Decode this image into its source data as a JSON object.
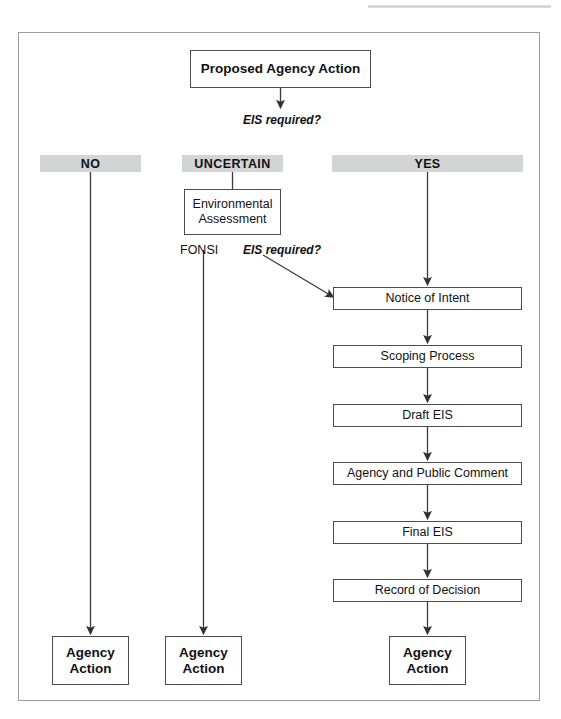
{
  "figure": {
    "frame": {
      "x": 18,
      "y": 32,
      "w": 522,
      "h": 669
    },
    "colors": {
      "band_fill": "#d2d4d6",
      "box_stroke": "#4b4d50",
      "frame_stroke": "#9a9c9f",
      "text": "#111214",
      "connector": "#3a3c3f",
      "page_background": "#ffffff"
    }
  },
  "nodes": {
    "proposed_action": {
      "label": "Proposed Agency Action",
      "x": 190,
      "y": 50,
      "w": 181,
      "h": 38,
      "style": "bold"
    },
    "environmental_assessment": {
      "label": "Environmental\nAssessment",
      "x": 184,
      "y": 189,
      "w": 97,
      "h": 46,
      "style": "plain"
    },
    "notice_of_intent": {
      "label": "Notice of Intent",
      "x": 333,
      "y": 287,
      "w": 189,
      "h": 23,
      "style": "plain"
    },
    "scoping_process": {
      "label": "Scoping Process",
      "x": 333,
      "y": 345,
      "w": 189,
      "h": 23,
      "style": "plain"
    },
    "draft_eis": {
      "label": "Draft EIS",
      "x": 333,
      "y": 404,
      "w": 189,
      "h": 23,
      "style": "plain"
    },
    "agency_public_comment": {
      "label": "Agency and Public Comment",
      "x": 333,
      "y": 462,
      "w": 189,
      "h": 23,
      "style": "plain"
    },
    "final_eis": {
      "label": "Final EIS",
      "x": 333,
      "y": 521,
      "w": 189,
      "h": 23,
      "style": "plain"
    },
    "record_of_decision": {
      "label": "Record of Decision",
      "x": 333,
      "y": 579,
      "w": 189,
      "h": 23,
      "style": "plain"
    },
    "agency_action_no": {
      "label": "Agency\nAction",
      "x": 52,
      "y": 636,
      "w": 77,
      "h": 49,
      "style": "bold"
    },
    "agency_action_uncertain": {
      "label": "Agency\nAction",
      "x": 165,
      "y": 636,
      "w": 77,
      "h": 49,
      "style": "bold"
    },
    "agency_action_yes": {
      "label": "Agency\nAction",
      "x": 389,
      "y": 636,
      "w": 77,
      "h": 49,
      "style": "bold"
    }
  },
  "bands": {
    "no": {
      "label": "NO",
      "x": 40,
      "y": 155,
      "w": 101,
      "h": 17
    },
    "uncertain": {
      "label": "UNCERTAIN",
      "x": 182,
      "y": 155,
      "w": 101,
      "h": 17
    },
    "yes": {
      "label": "YES",
      "x": 332,
      "y": 155,
      "w": 191,
      "h": 17
    }
  },
  "labels": {
    "eis_required_top": {
      "text": "EIS required?",
      "x": 243,
      "y": 113
    },
    "fonsi": {
      "text": "FONSI",
      "x": 180,
      "y": 243
    },
    "eis_required_branch": {
      "text": "EIS required?",
      "x": 243,
      "y": 243
    }
  },
  "chart_data": {
    "type": "diagram",
    "diagram_kind": "flowchart",
    "branches": [
      {
        "outcome": "NO",
        "path": [
          "Proposed Agency Action",
          "NO",
          "Agency Action"
        ]
      },
      {
        "outcome": "UNCERTAIN",
        "path": [
          "Proposed Agency Action",
          "UNCERTAIN",
          "Environmental Assessment",
          "FONSI",
          "Agency Action"
        ],
        "secondary_exit": "EIS required? -> Notice of Intent"
      },
      {
        "outcome": "YES",
        "path": [
          "Proposed Agency Action",
          "YES",
          "Notice of Intent",
          "Scoping Process",
          "Draft EIS",
          "Agency and Public Comment",
          "Final EIS",
          "Record of Decision",
          "Agency Action"
        ]
      }
    ],
    "decision_labels": [
      "EIS required?",
      "EIS required?"
    ],
    "terminal_nodes": 3,
    "edges": [
      {
        "from": "Proposed Agency Action",
        "to": "EIS required?",
        "kind": "arrow-down"
      },
      {
        "from": "NO",
        "to": "Agency Action",
        "kind": "arrow-down"
      },
      {
        "from": "UNCERTAIN",
        "to": "Environmental Assessment",
        "kind": "line-down"
      },
      {
        "from": "FONSI",
        "to": "Agency Action",
        "kind": "arrow-down"
      },
      {
        "from": "EIS required?",
        "to": "Notice of Intent",
        "kind": "arrow-diagonal"
      },
      {
        "from": "YES",
        "to": "Notice of Intent",
        "kind": "arrow-down"
      },
      {
        "from": "Notice of Intent",
        "to": "Scoping Process",
        "kind": "arrow-down"
      },
      {
        "from": "Scoping Process",
        "to": "Draft EIS",
        "kind": "arrow-down"
      },
      {
        "from": "Draft EIS",
        "to": "Agency and Public Comment",
        "kind": "arrow-down"
      },
      {
        "from": "Agency and Public Comment",
        "to": "Final EIS",
        "kind": "arrow-down"
      },
      {
        "from": "Final EIS",
        "to": "Record of Decision",
        "kind": "arrow-down"
      },
      {
        "from": "Record of Decision",
        "to": "Agency Action",
        "kind": "arrow-down"
      }
    ]
  }
}
